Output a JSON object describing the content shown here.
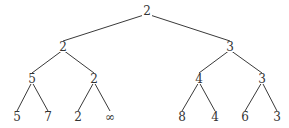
{
  "tree": {
    "nodes": [
      {
        "id": "n0",
        "label": "2",
        "x": 147,
        "y": 11
      },
      {
        "id": "n1",
        "label": "2",
        "x": 63,
        "y": 47
      },
      {
        "id": "n2",
        "label": "3",
        "x": 230,
        "y": 47
      },
      {
        "id": "n3",
        "label": "5",
        "x": 32,
        "y": 79
      },
      {
        "id": "n4",
        "label": "2",
        "x": 94,
        "y": 79
      },
      {
        "id": "n5",
        "label": "4",
        "x": 199,
        "y": 79
      },
      {
        "id": "n6",
        "label": "3",
        "x": 262,
        "y": 79
      },
      {
        "id": "n7",
        "label": "5",
        "x": 17,
        "y": 117
      },
      {
        "id": "n8",
        "label": "7",
        "x": 48,
        "y": 117
      },
      {
        "id": "n9",
        "label": "2",
        "x": 78,
        "y": 117
      },
      {
        "id": "n10",
        "label": "∞",
        "x": 110,
        "y": 117
      },
      {
        "id": "n11",
        "label": "8",
        "x": 182,
        "y": 117
      },
      {
        "id": "n12",
        "label": "4",
        "x": 215,
        "y": 117
      },
      {
        "id": "n13",
        "label": "6",
        "x": 245,
        "y": 117
      },
      {
        "id": "n14",
        "label": "3",
        "x": 277,
        "y": 117
      }
    ],
    "edges": [
      [
        "n0",
        "n1"
      ],
      [
        "n0",
        "n2"
      ],
      [
        "n1",
        "n3"
      ],
      [
        "n1",
        "n4"
      ],
      [
        "n2",
        "n5"
      ],
      [
        "n2",
        "n6"
      ],
      [
        "n3",
        "n7"
      ],
      [
        "n3",
        "n8"
      ],
      [
        "n4",
        "n9"
      ],
      [
        "n4",
        "n10"
      ],
      [
        "n5",
        "n11"
      ],
      [
        "n5",
        "n12"
      ],
      [
        "n6",
        "n13"
      ],
      [
        "n6",
        "n14"
      ]
    ]
  }
}
